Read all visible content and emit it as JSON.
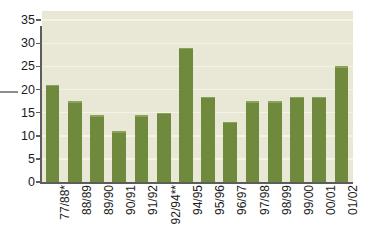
{
  "chart_data": {
    "type": "bar",
    "title": "",
    "subtitle": "",
    "xlabel": "",
    "ylabel": "",
    "categories": [
      "77/88*",
      "88/89",
      "89/90",
      "90/91",
      "91/92",
      "92/94**",
      "94/95",
      "95/96",
      "96/97",
      "97/98",
      "98/99",
      "99/00",
      "00/01",
      "01/02"
    ],
    "values": [
      21,
      17.5,
      14.5,
      11,
      14.5,
      15,
      29,
      18.5,
      13,
      17.5,
      17.5,
      18.5,
      18.5,
      25
    ],
    "ylim": [
      0,
      37
    ],
    "yticks": [
      0,
      5,
      10,
      15,
      20,
      25,
      30,
      35
    ],
    "ytick_labels": [
      "0",
      "5",
      "10",
      "15",
      "20",
      "25",
      "30",
      "35"
    ],
    "grid": true,
    "legend": "none",
    "series": [
      {
        "name": "",
        "values": [
          21,
          17.5,
          14.5,
          11,
          14.5,
          15,
          29,
          18.5,
          13,
          17.5,
          17.5,
          18.5,
          18.5,
          25
        ]
      }
    ],
    "colors": {
      "bar": "#6f8a3c",
      "bar_highlight": "#8ba356",
      "plot_background": "#e9e7d6",
      "gridline": "#f5f3e8",
      "axis": "#5d5d5d",
      "text": "#1a1a1a",
      "page_background": "#ffffff",
      "leader_line": "#8d8d8d"
    },
    "annotations": [
      {
        "name": "left-leader-dash",
        "text": "",
        "at_value": 20
      }
    ]
  }
}
